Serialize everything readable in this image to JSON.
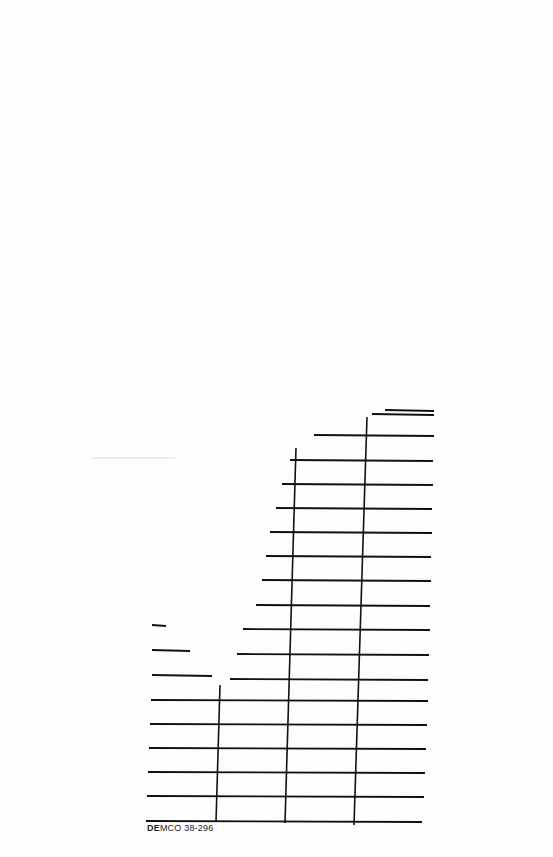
{
  "document": {
    "type": "library due-date slip (partially torn)",
    "label_prefix_bold": "DE",
    "label_rest": "MCO 38-296",
    "line_color": "#111111",
    "faint_line_color": "#dddddd"
  },
  "grid": {
    "horizontal_lines": [
      {
        "x1": 385,
        "x2": 434,
        "y": 410
      },
      {
        "x1": 372,
        "x2": 434,
        "y": 414
      },
      {
        "x1": 314,
        "x2": 434,
        "y": 435
      },
      {
        "x1": 290,
        "x2": 433,
        "y": 460
      },
      {
        "x1": 282,
        "x2": 433,
        "y": 484
      },
      {
        "x1": 276,
        "x2": 432,
        "y": 508
      },
      {
        "x1": 270,
        "x2": 432,
        "y": 532
      },
      {
        "x1": 266,
        "x2": 431,
        "y": 556
      },
      {
        "x1": 262,
        "x2": 431,
        "y": 580
      },
      {
        "x1": 256,
        "x2": 430,
        "y": 605
      },
      {
        "x1": 243,
        "x2": 430,
        "y": 629
      },
      {
        "x1": 237,
        "x2": 429,
        "y": 654
      },
      {
        "x1": 230,
        "x2": 428,
        "y": 679
      },
      {
        "x1": 152,
        "x2": 190,
        "y": 650
      },
      {
        "x1": 152,
        "x2": 212,
        "y": 675
      },
      {
        "x1": 151,
        "x2": 428,
        "y": 700
      },
      {
        "x1": 150,
        "x2": 427,
        "y": 724
      },
      {
        "x1": 149,
        "x2": 426,
        "y": 748
      },
      {
        "x1": 148,
        "x2": 425,
        "y": 772
      },
      {
        "x1": 147,
        "x2": 424,
        "y": 796
      },
      {
        "x1": 146,
        "x2": 422,
        "y": 821
      },
      {
        "x1": 152,
        "x2": 166,
        "y": 625
      }
    ],
    "vertical_lines": [
      {
        "x1": 367,
        "y1": 417,
        "x2": 354,
        "y2": 825
      },
      {
        "x1": 296,
        "y1": 448,
        "x2": 285,
        "y2": 823
      },
      {
        "x1": 220,
        "y1": 685,
        "x2": 216,
        "y2": 822
      }
    ],
    "faint_lines": [
      {
        "x1": 92,
        "x2": 175,
        "y": 458
      }
    ]
  }
}
